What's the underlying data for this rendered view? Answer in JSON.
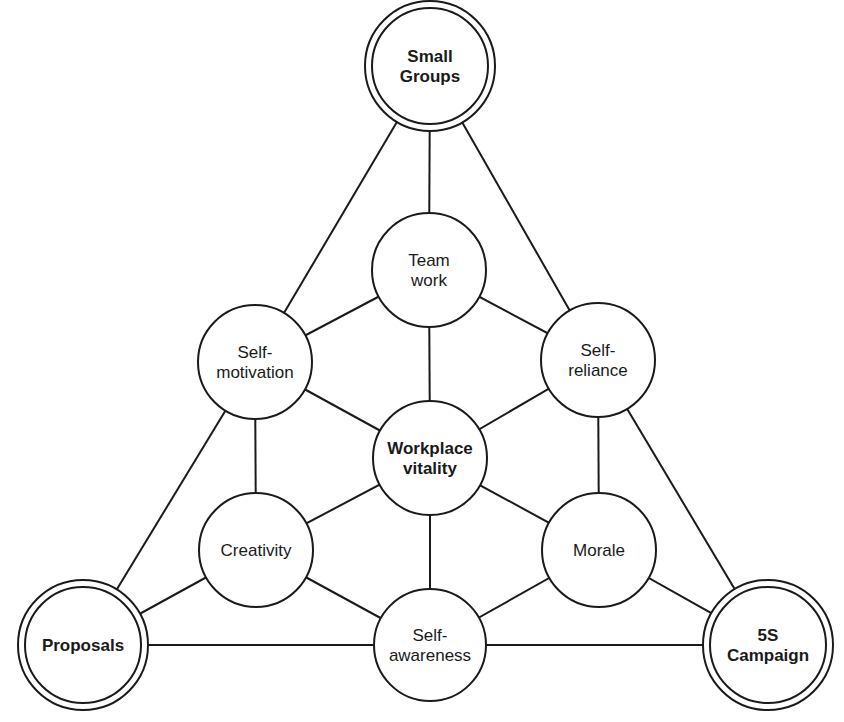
{
  "diagram": {
    "type": "network",
    "colors": {
      "stroke": "#1a1a1a",
      "fill": "#ffffff",
      "background": "#ffffff"
    },
    "nodes": [
      {
        "id": "small_groups",
        "lines": [
          "Small",
          "Groups"
        ],
        "bold": true,
        "double_ring": true,
        "cx": 430,
        "cy": 66,
        "r": 65
      },
      {
        "id": "teamwork",
        "lines": [
          "Team",
          "work"
        ],
        "bold": false,
        "double_ring": false,
        "cx": 429,
        "cy": 270,
        "r": 57
      },
      {
        "id": "self_motivation",
        "lines": [
          "Self-",
          "motivation"
        ],
        "bold": false,
        "double_ring": false,
        "cx": 255,
        "cy": 362,
        "r": 57
      },
      {
        "id": "self_reliance",
        "lines": [
          "Self-",
          "reliance"
        ],
        "bold": false,
        "double_ring": false,
        "cx": 598,
        "cy": 360,
        "r": 57
      },
      {
        "id": "workplace_vitality",
        "lines": [
          "Workplace",
          "vitality"
        ],
        "bold": true,
        "double_ring": false,
        "cx": 430,
        "cy": 458,
        "r": 57
      },
      {
        "id": "creativity",
        "lines": [
          "Creativity"
        ],
        "bold": false,
        "double_ring": false,
        "cx": 256,
        "cy": 550,
        "r": 57
      },
      {
        "id": "morale",
        "lines": [
          "Morale"
        ],
        "bold": false,
        "double_ring": false,
        "cx": 599,
        "cy": 550,
        "r": 57
      },
      {
        "id": "self_awareness",
        "lines": [
          "Self-",
          "awareness"
        ],
        "bold": false,
        "double_ring": false,
        "cx": 430,
        "cy": 645,
        "r": 56
      },
      {
        "id": "proposals",
        "lines": [
          "Proposals"
        ],
        "bold": true,
        "double_ring": true,
        "cx": 83,
        "cy": 645,
        "r": 65
      },
      {
        "id": "five_s_campaign",
        "lines": [
          "5S",
          "Campaign"
        ],
        "bold": true,
        "double_ring": true,
        "cx": 768,
        "cy": 645,
        "r": 65
      }
    ],
    "edges": [
      [
        "small_groups",
        "teamwork"
      ],
      [
        "small_groups",
        "self_motivation"
      ],
      [
        "small_groups",
        "self_reliance"
      ],
      [
        "teamwork",
        "self_motivation"
      ],
      [
        "teamwork",
        "self_reliance"
      ],
      [
        "teamwork",
        "workplace_vitality"
      ],
      [
        "self_motivation",
        "workplace_vitality"
      ],
      [
        "self_motivation",
        "creativity"
      ],
      [
        "self_motivation",
        "proposals"
      ],
      [
        "self_reliance",
        "workplace_vitality"
      ],
      [
        "self_reliance",
        "morale"
      ],
      [
        "self_reliance",
        "five_s_campaign"
      ],
      [
        "workplace_vitality",
        "creativity"
      ],
      [
        "workplace_vitality",
        "morale"
      ],
      [
        "workplace_vitality",
        "self_awareness"
      ],
      [
        "creativity",
        "proposals"
      ],
      [
        "creativity",
        "self_awareness"
      ],
      [
        "morale",
        "five_s_campaign"
      ],
      [
        "morale",
        "self_awareness"
      ],
      [
        "proposals",
        "self_awareness"
      ],
      [
        "self_awareness",
        "five_s_campaign"
      ]
    ]
  }
}
